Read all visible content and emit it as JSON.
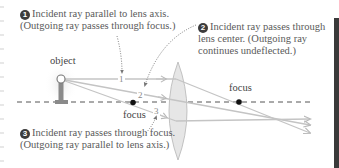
{
  "diagram": {
    "type": "thin convex lens ray diagram",
    "colors": {
      "ray": "#c4c4c4",
      "axis": "#555555",
      "lens_fill": "#e6e6e6",
      "lens_stroke": "#b5b5b5",
      "focus_dot": "#111111",
      "badge": "#3c3c3c",
      "text": "#5a5a5a",
      "dark_bar": "#3a3a3a"
    },
    "captions": [
      {
        "number": "1",
        "line1": "Incident ray parallel to lens axis.",
        "line2": "(Outgoing ray passes through focus.)"
      },
      {
        "number": "2",
        "line1": "Incident ray passes through",
        "line2": "lens center. (Outgoing ray",
        "line3": "continues undeflected.)"
      },
      {
        "number": "3",
        "line1": "Incident ray passes through focus.",
        "line2": "(Outgoing ray parallel to lens axis.)"
      }
    ],
    "labels": {
      "object": "object",
      "focus_right": "focus",
      "focus_left": "focus"
    },
    "ray_numbers": [
      "1",
      "2",
      "3"
    ],
    "icons": {
      "object": "lamp-post-object-icon",
      "lens": "convex-lens-icon",
      "focus": "focal-point-dot-icon"
    }
  }
}
